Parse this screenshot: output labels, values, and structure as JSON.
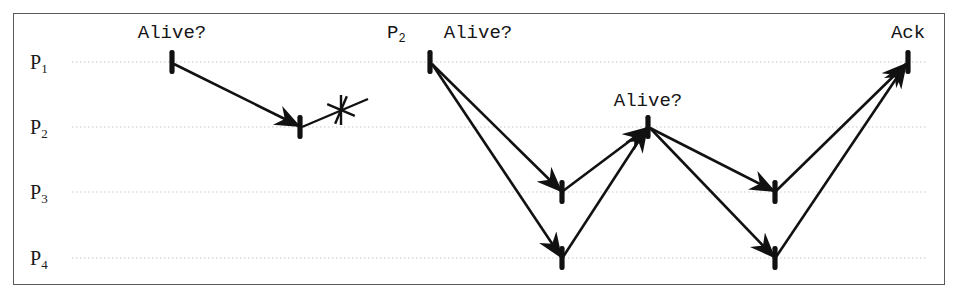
{
  "diagram": {
    "kind": "sequence-diagram",
    "background_color": "#ffffff",
    "frame_border_color": "#5a5a5a",
    "line_color": "#111111",
    "lifeline_color": "#c8c8c8",
    "lifelines": [
      {
        "id": "P1",
        "label": "P",
        "subscript": "1",
        "y": 62,
        "label_x": 30
      },
      {
        "id": "P2",
        "label": "P",
        "subscript": "2",
        "y": 127,
        "label_x": 30
      },
      {
        "id": "P3",
        "label": "P",
        "subscript": "3",
        "y": 192,
        "label_x": 30
      },
      {
        "id": "P4",
        "label": "P",
        "subscript": "4",
        "y": 258,
        "label_x": 30
      }
    ],
    "lifeline_x_start": 72,
    "lifeline_x_end": 928,
    "labels": [
      {
        "id": "alive-1",
        "text": "Alive?",
        "x": 172,
        "y": 33,
        "anchor": "center"
      },
      {
        "id": "p2-tag",
        "text": "P",
        "subscript": "2",
        "x": 387,
        "y": 33,
        "anchor": "left"
      },
      {
        "id": "alive-2",
        "text": "Alive?",
        "x": 478,
        "y": 33,
        "anchor": "center"
      },
      {
        "id": "alive-3",
        "text": "Alive?",
        "x": 648,
        "y": 101,
        "anchor": "center"
      },
      {
        "id": "ack",
        "text": "Ack",
        "x": 908,
        "y": 33,
        "anchor": "center"
      }
    ],
    "event_markers": [
      {
        "id": "m-p1-send-1",
        "x": 172,
        "y": 62,
        "process": "P1"
      },
      {
        "id": "m-p2-recv-1",
        "x": 300,
        "y": 127,
        "process": "P2"
      },
      {
        "id": "m-p1-send-2",
        "x": 430,
        "y": 62,
        "process": "P1"
      },
      {
        "id": "m-p3-recv-1",
        "x": 562,
        "y": 192,
        "process": "P3"
      },
      {
        "id": "m-p4-recv-1",
        "x": 562,
        "y": 258,
        "process": "P4"
      },
      {
        "id": "m-p2-relay",
        "x": 648,
        "y": 127,
        "process": "P2"
      },
      {
        "id": "m-p3-recv-2",
        "x": 775,
        "y": 192,
        "process": "P3"
      },
      {
        "id": "m-p4-recv-2",
        "x": 775,
        "y": 258,
        "process": "P4"
      },
      {
        "id": "m-p1-ack",
        "x": 908,
        "y": 62,
        "process": "P1"
      }
    ],
    "messages": [
      {
        "id": "msg-1",
        "label": "Alive?",
        "from": "P1",
        "to": "P2",
        "x1": 174,
        "y1": 64,
        "x2": 299,
        "y2": 126,
        "arrow": true
      },
      {
        "id": "msg-2",
        "label": "Alive?",
        "from": "P1",
        "to": "P3",
        "x1": 432,
        "y1": 64,
        "x2": 561,
        "y2": 191,
        "arrow": true
      },
      {
        "id": "msg-3",
        "label": "Alive?",
        "from": "P1",
        "to": "P4",
        "x1": 432,
        "y1": 64,
        "x2": 561,
        "y2": 257,
        "arrow": true
      },
      {
        "id": "msg-4",
        "label": "",
        "from": "P3",
        "to": "P2",
        "x1": 563,
        "y1": 191,
        "x2": 647,
        "y2": 128,
        "arrow": true
      },
      {
        "id": "msg-5",
        "label": "",
        "from": "P4",
        "to": "P2",
        "x1": 563,
        "y1": 257,
        "x2": 647,
        "y2": 128,
        "arrow": true
      },
      {
        "id": "msg-6",
        "label": "Alive?",
        "from": "P2",
        "to": "P3",
        "x1": 650,
        "y1": 128,
        "x2": 774,
        "y2": 191,
        "arrow": true
      },
      {
        "id": "msg-7",
        "label": "Alive?",
        "from": "P2",
        "to": "P4",
        "x1": 650,
        "y1": 128,
        "x2": 774,
        "y2": 257,
        "arrow": true
      },
      {
        "id": "msg-8",
        "label": "Ack",
        "from": "P3",
        "to": "P1",
        "x1": 776,
        "y1": 191,
        "x2": 906,
        "y2": 64,
        "arrow": true
      },
      {
        "id": "msg-9",
        "label": "Ack",
        "from": "P4",
        "to": "P1",
        "x1": 776,
        "y1": 257,
        "x2": 906,
        "y2": 64,
        "arrow": true
      }
    ],
    "failure_mark": {
      "id": "crash-x",
      "description": "crossed-out reply from P2 indicating no response / process failure",
      "line": {
        "x1": 302,
        "y1": 127,
        "x2": 368,
        "y2": 99
      },
      "cross_center": {
        "x": 341,
        "y": 110
      },
      "cross_size": 15
    }
  }
}
